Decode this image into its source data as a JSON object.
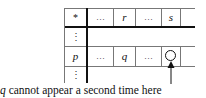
{
  "diagram": {
    "header_row": {
      "corner": "*",
      "cells": [
        "…",
        "r",
        "…",
        "s"
      ]
    },
    "vdots": "⋮",
    "row_p": {
      "label": "p",
      "cells": [
        "…",
        "q",
        "…"
      ],
      "marked_cell": "circle"
    },
    "arrow_target": "circle-cell",
    "caption_var": "q",
    "caption_rest": " cannot appear a second time here"
  }
}
